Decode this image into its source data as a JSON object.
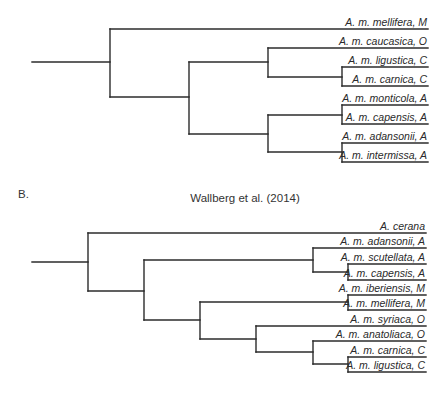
{
  "figure": {
    "panels": [
      {
        "id": "A",
        "panel_label": "",
        "title": "",
        "label_right_x": 427,
        "line_right_x": 428,
        "leaves": [
          {
            "name": "A. m. mellifera, M",
            "y": 29,
            "x_start": 110
          },
          {
            "name": "A. m. caucasica, O",
            "y": 48,
            "x_start": 268
          },
          {
            "name": "A. m. ligustica, C",
            "y": 67,
            "x_start": 342
          },
          {
            "name": "A. m. carnica, C",
            "y": 86,
            "x_start": 342
          },
          {
            "name": "A. m. monticola, A",
            "y": 105,
            "x_start": 342
          },
          {
            "name": "A. m. capensis, A",
            "y": 124,
            "x_start": 342
          },
          {
            "name": "A. m. adansonii, A",
            "y": 143,
            "x_start": 342
          },
          {
            "name": "A. m. intermissa, A",
            "y": 162,
            "x_start": 342
          }
        ],
        "segments": [
          [
            32,
            62,
            110,
            62
          ],
          [
            110,
            29,
            110,
            97
          ],
          [
            110,
            97,
            189,
            97
          ],
          [
            189,
            62,
            189,
            134
          ],
          [
            189,
            62,
            268,
            62
          ],
          [
            268,
            48,
            268,
            77
          ],
          [
            268,
            77,
            342,
            77
          ],
          [
            342,
            67,
            342,
            86
          ],
          [
            189,
            134,
            268,
            134
          ],
          [
            268,
            115,
            268,
            152
          ],
          [
            268,
            115,
            342,
            115
          ],
          [
            342,
            105,
            342,
            124
          ],
          [
            268,
            152,
            342,
            152
          ],
          [
            342,
            143,
            342,
            162
          ]
        ]
      },
      {
        "id": "B",
        "panel_label": "B.",
        "panel_label_pos": {
          "x": 18,
          "y": 198
        },
        "title": "Wallberg et al. (2014)",
        "title_pos": {
          "x": 245,
          "y": 202
        },
        "label_right_x": 425,
        "line_right_x": 426,
        "leaves": [
          {
            "name": "A. cerana",
            "y": 233,
            "x_start": 88
          },
          {
            "name": "A. m. adansonii, A",
            "y": 248,
            "x_start": 313
          },
          {
            "name": "A. m. scutellata, A",
            "y": 264,
            "x_start": 348
          },
          {
            "name": "A. m. capensis, A",
            "y": 280,
            "x_start": 348
          },
          {
            "name": "A. m. iberiensis, M",
            "y": 295,
            "x_start": 348
          },
          {
            "name": "A. m. mellifera, M",
            "y": 310,
            "x_start": 348
          },
          {
            "name": "A. m. syriaca, O",
            "y": 326,
            "x_start": 256
          },
          {
            "name": "A. m. anatoliaca, O",
            "y": 341,
            "x_start": 313
          },
          {
            "name": "A. m. carnica, C",
            "y": 357,
            "x_start": 348
          },
          {
            "name": "A. m. ligustica, C",
            "y": 372,
            "x_start": 348
          }
        ],
        "segments": [
          [
            32,
            262,
            88,
            262
          ],
          [
            88,
            233,
            88,
            291
          ],
          [
            88,
            291,
            144,
            291
          ],
          [
            144,
            260,
            144,
            320
          ],
          [
            144,
            260,
            313,
            260
          ],
          [
            313,
            248,
            313,
            272
          ],
          [
            313,
            272,
            348,
            272
          ],
          [
            348,
            264,
            348,
            280
          ],
          [
            144,
            320,
            200,
            320
          ],
          [
            200,
            302,
            200,
            339
          ],
          [
            200,
            302,
            348,
            302
          ],
          [
            348,
            295,
            348,
            310
          ],
          [
            200,
            339,
            256,
            339
          ],
          [
            256,
            326,
            256,
            352
          ],
          [
            256,
            352,
            313,
            352
          ],
          [
            313,
            341,
            313,
            364
          ],
          [
            313,
            364,
            348,
            364
          ],
          [
            348,
            357,
            348,
            372
          ]
        ]
      }
    ]
  }
}
